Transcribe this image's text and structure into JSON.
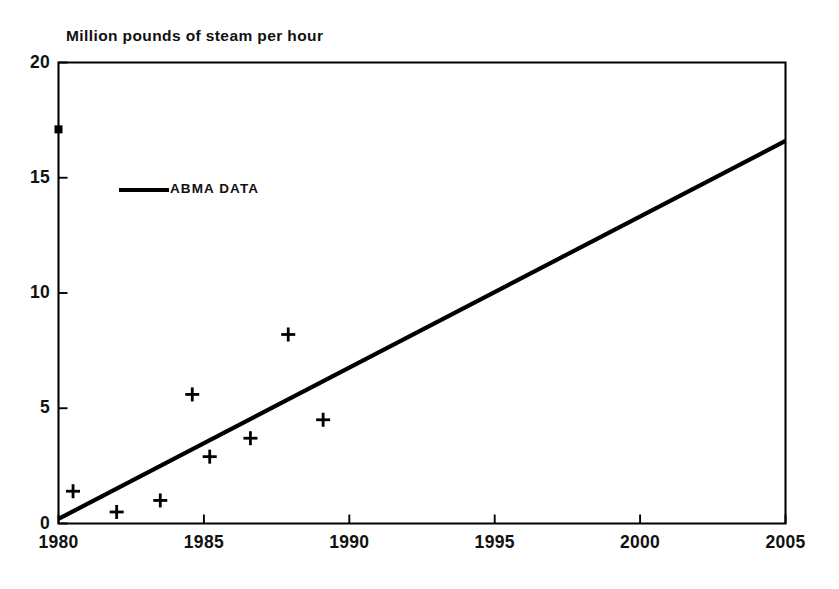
{
  "chart_data": {
    "type": "scatter",
    "title": "Million pounds of steam per hour",
    "xlabel": "",
    "ylabel": "",
    "xlim": [
      1980,
      2005
    ],
    "ylim": [
      0,
      20
    ],
    "xticks": [
      1980,
      1985,
      1990,
      1995,
      2000,
      2005
    ],
    "yticks": [
      0,
      5,
      10,
      15,
      20
    ],
    "grid": false,
    "legend_position": "upper-left",
    "legend": [
      {
        "label": "ABMA DATA",
        "marker": "line"
      }
    ],
    "series": [
      {
        "name": "ABMA DATA",
        "type": "line",
        "x": [
          1980,
          2005
        ],
        "y": [
          0.2,
          16.6
        ]
      },
      {
        "name": "Observations",
        "type": "scatter",
        "marker": "plus",
        "points": [
          {
            "x": 1980.0,
            "y": 17.1,
            "marker": "square"
          },
          {
            "x": 1980.5,
            "y": 1.4,
            "marker": "plus"
          },
          {
            "x": 1982.0,
            "y": 0.5,
            "marker": "plus"
          },
          {
            "x": 1983.5,
            "y": 1.0,
            "marker": "plus"
          },
          {
            "x": 1984.6,
            "y": 5.6,
            "marker": "plus"
          },
          {
            "x": 1985.2,
            "y": 2.9,
            "marker": "plus"
          },
          {
            "x": 1986.6,
            "y": 3.7,
            "marker": "plus"
          },
          {
            "x": 1987.9,
            "y": 8.2,
            "marker": "plus"
          },
          {
            "x": 1989.1,
            "y": 4.5,
            "marker": "plus"
          }
        ]
      }
    ]
  },
  "axis": {
    "y_labels": [
      "20",
      "15",
      "10",
      "5",
      "0"
    ],
    "x_labels": [
      "1980",
      "1985",
      "1990",
      "1995",
      "2000",
      "2005"
    ]
  },
  "colors": {
    "ink": "#000000",
    "background": "#ffffff"
  }
}
